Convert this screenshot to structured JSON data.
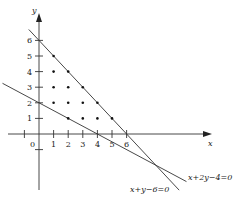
{
  "diagram": {
    "type": "coordinate-plane-feasible-region",
    "x_axis_label": "x",
    "y_axis_label": "y",
    "origin_label": "0",
    "x_ticks": [
      1,
      2,
      3,
      4,
      5,
      6
    ],
    "y_ticks": [
      1,
      2,
      3,
      4,
      5,
      6
    ],
    "x_tick_labels_shown": [
      "1",
      "2",
      "3",
      "4",
      "5",
      "6"
    ],
    "y_tick_labels_shown": [
      "1",
      "2",
      "3",
      "4",
      "5",
      "6"
    ],
    "x_range": [
      -1,
      10
    ],
    "y_range": [
      -3.6,
      8
    ],
    "lines": [
      {
        "label": "x+y−6=0",
        "a": 1,
        "b": 1,
        "c": -6,
        "from_x": -0.7,
        "to_x": 9.6
      },
      {
        "label": "x+2y−4=0",
        "a": 1,
        "b": 2,
        "c": -4,
        "from_x": -2.5,
        "to_x": 10.1
      }
    ],
    "lattice_points": [
      [
        1,
        5
      ],
      [
        1,
        4
      ],
      [
        2,
        4
      ],
      [
        1,
        3
      ],
      [
        2,
        3
      ],
      [
        3,
        3
      ],
      [
        1,
        2
      ],
      [
        2,
        2
      ],
      [
        3,
        2
      ],
      [
        4,
        2
      ],
      [
        2,
        1
      ],
      [
        3,
        1
      ],
      [
        4,
        1
      ],
      [
        5,
        1
      ]
    ],
    "lines_intersection": [
      8,
      -2
    ]
  }
}
